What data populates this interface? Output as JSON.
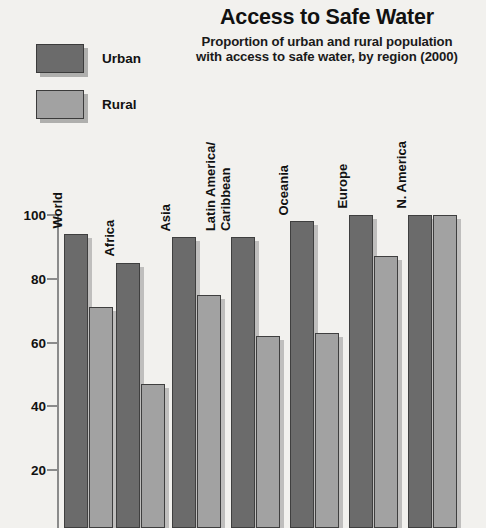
{
  "title": "Access to Safe Water",
  "subtitle_line1": "Proportion of urban and rural  population",
  "subtitle_line2": "with access to safe water, by region (2000)",
  "legend": {
    "urban_label": "Urban",
    "rural_label": "Rural",
    "urban_color": "#6b6b6b",
    "rural_color": "#a2a2a2"
  },
  "axis": {
    "ticks": [
      "100",
      "80",
      "60",
      "40",
      "20"
    ],
    "tick_values": [
      100,
      80,
      60,
      40,
      20
    ]
  },
  "chart_data": {
    "type": "bar",
    "title": "Access to Safe Water",
    "subtitle": "Proportion of urban and rural  population with access to safe water, by region (2000)",
    "xlabel": "",
    "ylabel": "",
    "ylim": [
      0,
      105
    ],
    "grid": false,
    "legend_position": "top-left",
    "categories": [
      "World",
      "Africa",
      "Asia",
      "Latin America/\nCaribbean",
      "Oceania",
      "Europe",
      "N. America"
    ],
    "series": [
      {
        "name": "Urban",
        "color": "#6b6b6b",
        "values": [
          94,
          85,
          93,
          93,
          98,
          100,
          100
        ]
      },
      {
        "name": "Rural",
        "color": "#a2a2a2",
        "values": [
          71,
          47,
          75,
          62,
          63,
          87,
          100
        ]
      }
    ],
    "ytick_labels": [
      "20",
      "40",
      "60",
      "80",
      "100"
    ],
    "ytick_values": [
      20,
      40,
      60,
      80,
      100
    ]
  }
}
